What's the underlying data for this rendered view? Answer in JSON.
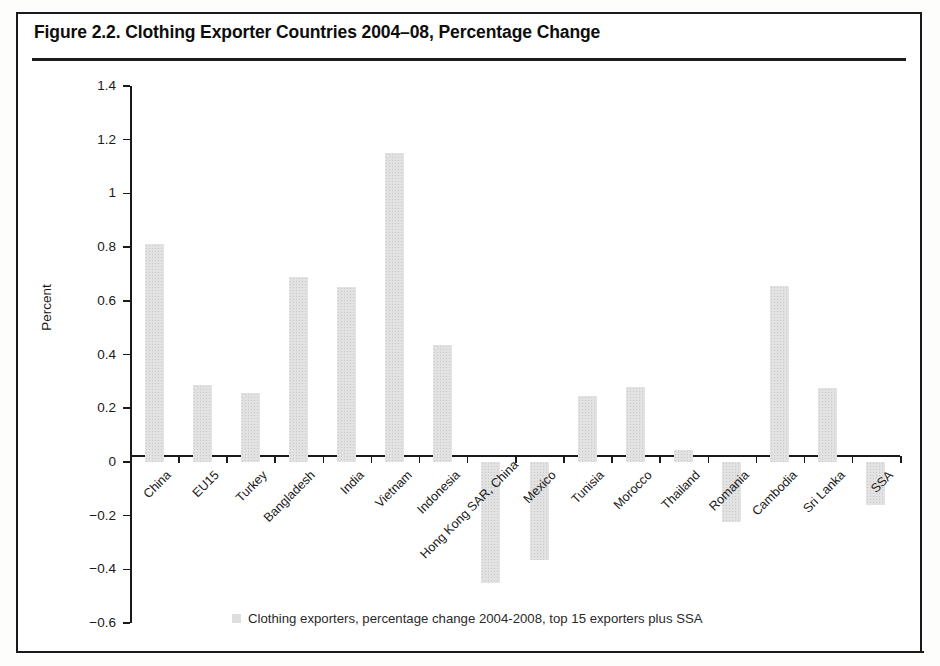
{
  "figure": {
    "title": "Figure 2.2. Clothing Exporter Countries 2004–08, Percentage Change"
  },
  "chart_data": {
    "type": "bar",
    "title": "Figure 2.2. Clothing Exporter Countries 2004–08, Percentage Change",
    "xlabel": "",
    "ylabel": "Percent",
    "ylim": [
      -0.6,
      1.4
    ],
    "ytick_labels": [
      "1.4",
      "1.2",
      "1",
      "0.8",
      "0.6",
      "0.4",
      "0.2",
      "0",
      "-0.2",
      "-0.4",
      "-0.6"
    ],
    "ytick_values": [
      1.4,
      1.2,
      1.0,
      0.8,
      0.6,
      0.4,
      0.2,
      0,
      -0.2,
      -0.4,
      -0.6
    ],
    "grid": false,
    "legend_position": "bottom",
    "legend": [
      "Clothing exporters, percentage change 2004-2008, top 15 exporters plus SSA"
    ],
    "bar_color": "#e2e2e2",
    "categories": [
      "China",
      "EU15",
      "Turkey",
      "Bangladesh",
      "India",
      "Vietnam",
      "Indonesia",
      "Hong Kong SAR, China",
      "Mexico",
      "Tunisia",
      "Morocco",
      "Thailand",
      "Romania",
      "Cambodia",
      "Sri Lanka",
      "SSA"
    ],
    "values": [
      0.81,
      0.285,
      0.255,
      0.69,
      0.65,
      1.15,
      0.435,
      -0.45,
      -0.365,
      0.245,
      0.28,
      0.045,
      -0.225,
      0.655,
      0.275,
      -0.16
    ]
  }
}
